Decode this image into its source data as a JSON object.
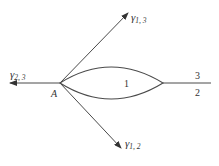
{
  "diagram": {
    "type": "interface tension / triple junction",
    "point_label": "A",
    "region_label": "1",
    "right_line": {
      "upper_label": "3",
      "lower_label": "2"
    },
    "vectors": [
      {
        "id": "gamma_2_3",
        "symbol": "γ",
        "subscript": "2, 3",
        "direction": "left"
      },
      {
        "id": "gamma_1_3",
        "symbol": "γ",
        "subscript": "1, 3",
        "direction": "upper-right"
      },
      {
        "id": "gamma_1_2",
        "symbol": "γ",
        "subscript": "1, 2",
        "direction": "lower-right"
      }
    ],
    "colors": {
      "stroke": "#4a4a4a",
      "text": "#333333",
      "background": "#ffffff"
    }
  }
}
